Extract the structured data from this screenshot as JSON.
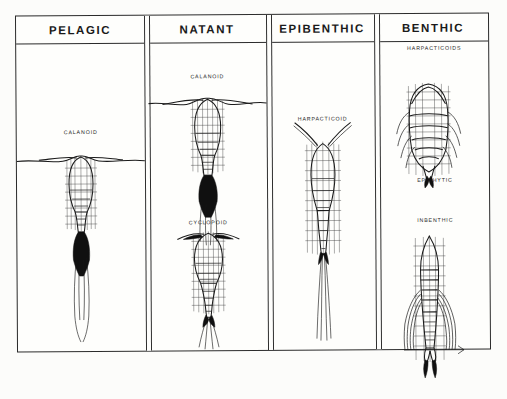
{
  "figure": {
    "background_color": "#fdfdfb",
    "ink_color": "#1b1b1b",
    "columns": [
      {
        "id": "pelagic",
        "header": "PELAGIC",
        "specimens": [
          {
            "label": "CALANOID",
            "form": "elongate-oval prosome, long horizontal first antennae, plumose caudal setae"
          }
        ],
        "has_water_surface_line": true
      },
      {
        "id": "natant",
        "header": "NATANT",
        "specimens": [
          {
            "label": "CALANOID",
            "form": "oval prosome, wide horizontal antennae, dark plumose caudal setae"
          },
          {
            "label": "CYCLOPOID",
            "form": "teardrop prosome, short antennae, tapering urosome, fine caudal setae"
          }
        ],
        "has_water_surface_line": true
      },
      {
        "id": "epibenthic",
        "header": "EPIBENTHIC",
        "specimens": [
          {
            "label": "HARPACTICOID",
            "form": "tapered cylindrical body, short V-shaped antennae, long caudal rami"
          }
        ],
        "has_water_surface_line": false
      },
      {
        "id": "benthic",
        "header": "BENTHIC",
        "group_label": "HARPACTICOIDS",
        "specimens": [
          {
            "label": "EPIPHYTIC",
            "form": "broad dorsoventrally flattened body, strongly segmented, lateral setae fringe"
          },
          {
            "label": "INBENTHIC",
            "form": "slender vermiform body, long trailing swimming legs, short caudal rami"
          }
        ],
        "has_water_surface_line": false
      }
    ]
  }
}
